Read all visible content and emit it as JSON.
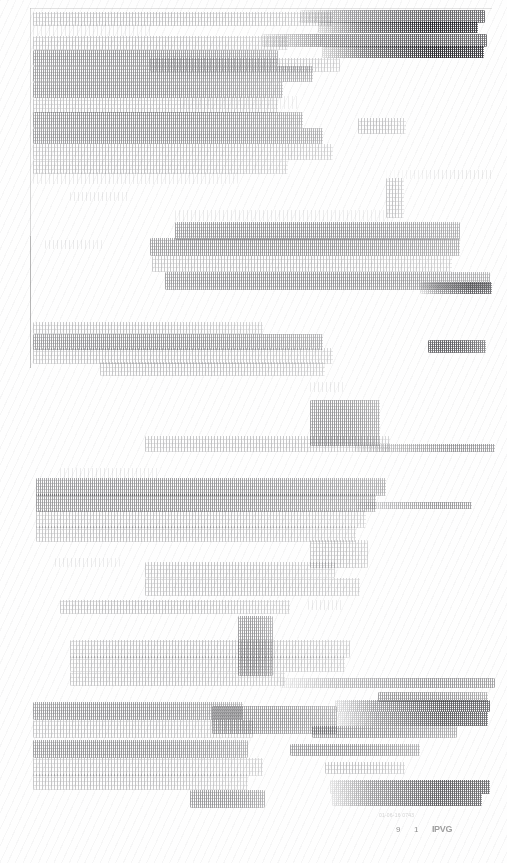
{
  "document": {
    "kind": "scanned-page",
    "condition": "severely degraded, faded and speckled; body text illegible",
    "page_background": "#fefefe",
    "ink_color": "#1a1a1f",
    "width": 507,
    "height": 863
  },
  "page_edge": {
    "top_rule_visible": true,
    "left_rule_visible": true
  },
  "footer": {
    "glyph_1": "9",
    "glyph_2": "1",
    "stamp": "IPVG",
    "note": "01-06-16  0743"
  },
  "content_blocks": [
    {
      "id": "b1",
      "x": 33,
      "y": 12,
      "w": 300,
      "h": 14,
      "density": "d1",
      "feather": "feather"
    },
    {
      "id": "b2",
      "x": 300,
      "y": 10,
      "w": 185,
      "h": 13,
      "density": "d3",
      "feather": "feather-r"
    },
    {
      "id": "b3",
      "x": 318,
      "y": 22,
      "w": 160,
      "h": 11,
      "density": "d4",
      "feather": "feather-r"
    },
    {
      "id": "b4",
      "x": 33,
      "y": 24,
      "w": 120,
      "h": 12,
      "density": "d0",
      "feather": "feather"
    },
    {
      "id": "b5",
      "x": 33,
      "y": 36,
      "w": 255,
      "h": 14,
      "density": "d1",
      "feather": "feather"
    },
    {
      "id": "b6",
      "x": 262,
      "y": 34,
      "w": 225,
      "h": 13,
      "density": "d3",
      "feather": "feather-r"
    },
    {
      "id": "b7",
      "x": 322,
      "y": 46,
      "w": 162,
      "h": 12,
      "density": "d4",
      "feather": "feather-r"
    },
    {
      "id": "b8",
      "x": 33,
      "y": 50,
      "w": 245,
      "h": 16,
      "density": "d2",
      "feather": "feather"
    },
    {
      "id": "b9",
      "x": 150,
      "y": 58,
      "w": 190,
      "h": 14,
      "density": "d1",
      "feather": "feather"
    },
    {
      "id": "b10",
      "x": 33,
      "y": 66,
      "w": 280,
      "h": 16,
      "density": "d2",
      "feather": "feather"
    },
    {
      "id": "b11",
      "x": 33,
      "y": 82,
      "w": 250,
      "h": 16,
      "density": "d2",
      "feather": "feather"
    },
    {
      "id": "b12",
      "x": 33,
      "y": 98,
      "w": 245,
      "h": 15,
      "density": "d1",
      "feather": "feather"
    },
    {
      "id": "b13",
      "x": 180,
      "y": 96,
      "w": 120,
      "h": 13,
      "density": "d0",
      "feather": "feather"
    },
    {
      "id": "b14",
      "x": 33,
      "y": 112,
      "w": 270,
      "h": 16,
      "density": "d2",
      "feather": "feather"
    },
    {
      "id": "b15",
      "x": 358,
      "y": 118,
      "w": 48,
      "h": 16,
      "density": "d1",
      "feather": "feather"
    },
    {
      "id": "b16",
      "x": 33,
      "y": 128,
      "w": 290,
      "h": 16,
      "density": "d2",
      "feather": "feather"
    },
    {
      "id": "b17",
      "x": 33,
      "y": 144,
      "w": 300,
      "h": 16,
      "density": "d1",
      "feather": "feather"
    },
    {
      "id": "b18",
      "x": 33,
      "y": 160,
      "w": 255,
      "h": 14,
      "density": "d1",
      "feather": "feather"
    },
    {
      "id": "b19",
      "x": 33,
      "y": 172,
      "w": 205,
      "h": 12,
      "density": "d0",
      "feather": "feather"
    },
    {
      "id": "b20",
      "x": 386,
      "y": 170,
      "w": 108,
      "h": 9,
      "density": "d0",
      "feather": "feather-r"
    },
    {
      "id": "b21",
      "x": 386,
      "y": 178,
      "w": 18,
      "h": 40,
      "density": "d1",
      "feather": "feather"
    },
    {
      "id": "b22",
      "x": 70,
      "y": 192,
      "w": 60,
      "h": 9,
      "density": "d0",
      "feather": "feather"
    },
    {
      "id": "b23",
      "x": 175,
      "y": 210,
      "w": 215,
      "h": 11,
      "density": "d0",
      "feather": "feather"
    },
    {
      "id": "b24",
      "x": 175,
      "y": 222,
      "w": 285,
      "h": 18,
      "density": "d2",
      "feather": "feather"
    },
    {
      "id": "b25",
      "x": 150,
      "y": 238,
      "w": 310,
      "h": 18,
      "density": "d2",
      "feather": "feather"
    },
    {
      "id": "b26",
      "x": 45,
      "y": 240,
      "w": 60,
      "h": 9,
      "density": "d0",
      "feather": "feather"
    },
    {
      "id": "b27",
      "x": 152,
      "y": 256,
      "w": 300,
      "h": 16,
      "density": "d1",
      "feather": "feather"
    },
    {
      "id": "b28",
      "x": 165,
      "y": 272,
      "w": 325,
      "h": 18,
      "density": "d2",
      "feather": "feather"
    },
    {
      "id": "b29",
      "x": 420,
      "y": 282,
      "w": 72,
      "h": 12,
      "density": "d3",
      "feather": "feather-r"
    },
    {
      "id": "b30",
      "x": 33,
      "y": 322,
      "w": 230,
      "h": 12,
      "density": "d1",
      "feather": "feather"
    },
    {
      "id": "b31",
      "x": 33,
      "y": 334,
      "w": 290,
      "h": 16,
      "density": "d2",
      "feather": "feather"
    },
    {
      "id": "b32",
      "x": 33,
      "y": 348,
      "w": 300,
      "h": 16,
      "density": "d1",
      "feather": "feather"
    },
    {
      "id": "b33",
      "x": 428,
      "y": 340,
      "w": 58,
      "h": 13,
      "density": "d3",
      "feather": "feather"
    },
    {
      "id": "b34",
      "x": 100,
      "y": 362,
      "w": 225,
      "h": 14,
      "density": "d1",
      "feather": "feather"
    },
    {
      "id": "b35",
      "x": 310,
      "y": 382,
      "w": 36,
      "h": 10,
      "density": "d0",
      "feather": "feather"
    },
    {
      "id": "b36",
      "x": 310,
      "y": 400,
      "w": 70,
      "h": 46,
      "density": "d2",
      "feather": "feather"
    },
    {
      "id": "b37",
      "x": 145,
      "y": 436,
      "w": 245,
      "h": 16,
      "density": "d1",
      "feather": "feather"
    },
    {
      "id": "b38",
      "x": 355,
      "y": 444,
      "w": 140,
      "h": 8,
      "density": "d2",
      "feather": "feather-r"
    },
    {
      "id": "b39",
      "x": 60,
      "y": 468,
      "w": 100,
      "h": 10,
      "density": "d0",
      "feather": "feather"
    },
    {
      "id": "b40",
      "x": 36,
      "y": 478,
      "w": 350,
      "h": 18,
      "density": "d2",
      "feather": "feather"
    },
    {
      "id": "b41",
      "x": 36,
      "y": 494,
      "w": 340,
      "h": 18,
      "density": "d2",
      "feather": "feather"
    },
    {
      "id": "b42",
      "x": 356,
      "y": 502,
      "w": 116,
      "h": 7,
      "density": "d2",
      "feather": "feather-r"
    },
    {
      "id": "b43",
      "x": 36,
      "y": 510,
      "w": 330,
      "h": 18,
      "density": "d1",
      "feather": "feather"
    },
    {
      "id": "b44",
      "x": 36,
      "y": 526,
      "w": 320,
      "h": 16,
      "density": "d1",
      "feather": "feather"
    },
    {
      "id": "b45",
      "x": 310,
      "y": 540,
      "w": 58,
      "h": 28,
      "density": "d1",
      "feather": "feather"
    },
    {
      "id": "b46",
      "x": 55,
      "y": 558,
      "w": 65,
      "h": 9,
      "density": "d0",
      "feather": "feather"
    },
    {
      "id": "b47",
      "x": 145,
      "y": 562,
      "w": 190,
      "h": 16,
      "density": "d1",
      "feather": "feather"
    },
    {
      "id": "b48",
      "x": 145,
      "y": 578,
      "w": 215,
      "h": 18,
      "density": "d1",
      "feather": "feather"
    },
    {
      "id": "b49",
      "x": 60,
      "y": 600,
      "w": 230,
      "h": 14,
      "density": "d1",
      "feather": "feather"
    },
    {
      "id": "b50",
      "x": 308,
      "y": 600,
      "w": 36,
      "h": 10,
      "density": "d0",
      "feather": "feather"
    },
    {
      "id": "b51",
      "x": 238,
      "y": 616,
      "w": 35,
      "h": 60,
      "density": "d2",
      "feather": "feather"
    },
    {
      "id": "b52",
      "x": 70,
      "y": 640,
      "w": 280,
      "h": 18,
      "density": "d1",
      "feather": "feather"
    },
    {
      "id": "b53",
      "x": 70,
      "y": 656,
      "w": 275,
      "h": 16,
      "density": "d1",
      "feather": "feather"
    },
    {
      "id": "b54",
      "x": 70,
      "y": 672,
      "w": 215,
      "h": 14,
      "density": "d1",
      "feather": "feather"
    },
    {
      "id": "b55",
      "x": 280,
      "y": 678,
      "w": 215,
      "h": 10,
      "density": "d2",
      "feather": "feather-r"
    },
    {
      "id": "b56",
      "x": 378,
      "y": 692,
      "w": 110,
      "h": 10,
      "density": "d2",
      "feather": "feather"
    },
    {
      "id": "b57",
      "x": 335,
      "y": 700,
      "w": 155,
      "h": 12,
      "density": "d3",
      "feather": "feather-r"
    },
    {
      "id": "b58",
      "x": 338,
      "y": 712,
      "w": 150,
      "h": 14,
      "density": "d3",
      "feather": "feather-r"
    },
    {
      "id": "b59",
      "x": 33,
      "y": 702,
      "w": 210,
      "h": 18,
      "density": "d2",
      "feather": "feather"
    },
    {
      "id": "b60",
      "x": 212,
      "y": 706,
      "w": 125,
      "h": 28,
      "density": "d2",
      "feather": "feather"
    },
    {
      "id": "b61",
      "x": 33,
      "y": 720,
      "w": 220,
      "h": 18,
      "density": "d1",
      "feather": "feather"
    },
    {
      "id": "b62",
      "x": 312,
      "y": 726,
      "w": 145,
      "h": 12,
      "density": "d2",
      "feather": "feather"
    },
    {
      "id": "b63",
      "x": 33,
      "y": 740,
      "w": 215,
      "h": 18,
      "density": "d2",
      "feather": "feather"
    },
    {
      "id": "b64",
      "x": 290,
      "y": 744,
      "w": 130,
      "h": 12,
      "density": "d2",
      "feather": "feather"
    },
    {
      "id": "b65",
      "x": 33,
      "y": 758,
      "w": 230,
      "h": 18,
      "density": "d1",
      "feather": "feather"
    },
    {
      "id": "b66",
      "x": 325,
      "y": 762,
      "w": 80,
      "h": 12,
      "density": "d1",
      "feather": "feather"
    },
    {
      "id": "b67",
      "x": 33,
      "y": 774,
      "w": 215,
      "h": 16,
      "density": "d1",
      "feather": "feather"
    },
    {
      "id": "b68",
      "x": 330,
      "y": 780,
      "w": 160,
      "h": 14,
      "density": "d3",
      "feather": "feather-r"
    },
    {
      "id": "b69",
      "x": 190,
      "y": 790,
      "w": 75,
      "h": 18,
      "density": "d2",
      "feather": "feather"
    },
    {
      "id": "b70",
      "x": 332,
      "y": 794,
      "w": 150,
      "h": 12,
      "density": "d3",
      "feather": "feather-r"
    }
  ]
}
